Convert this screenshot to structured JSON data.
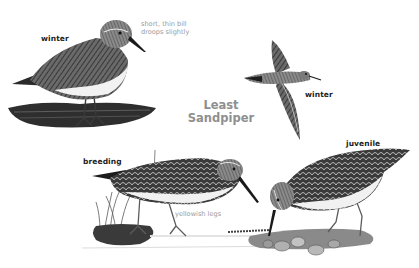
{
  "plate": {
    "title_line1": "Least",
    "title_line2": "Sandpiper",
    "colors": {
      "background": "#ffffff",
      "label": "#1c1c1c",
      "note": "#9a9a9a",
      "title": "#8f8f8f",
      "ink": "#2a2a2a"
    }
  },
  "figures": [
    {
      "id": "winter-standing",
      "label": "winter",
      "note_line1": "short, thin bill",
      "note_line2": "droops slightly"
    },
    {
      "id": "winter-flying",
      "label": "winter"
    },
    {
      "id": "breeding",
      "label": "breeding",
      "note": "yellowish legs"
    },
    {
      "id": "juvenile",
      "label": "juvenile"
    }
  ]
}
